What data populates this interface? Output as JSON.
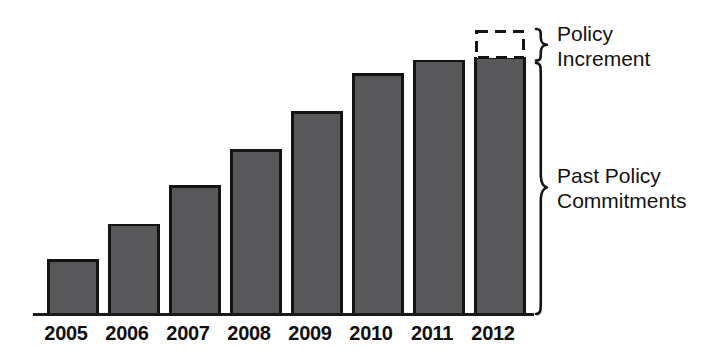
{
  "chart_data": {
    "type": "bar",
    "title": "",
    "subtitle": "",
    "xlabel": "",
    "ylabel": "",
    "grid": false,
    "legend_position": "right-brace-annotations",
    "categories": [
      "2005",
      "2006",
      "2007",
      "2008",
      "2009",
      "2010",
      "2011",
      "2012"
    ],
    "series": [
      {
        "name": "Past Policy Commitments",
        "values": [
          20.9,
          34.8,
          49.8,
          64.0,
          78.8,
          93.7,
          98.9,
          100.0
        ]
      }
    ],
    "values": [
      20.9,
      34.8,
      49.8,
      64.0,
      78.8,
      93.7,
      98.9,
      100.0
    ],
    "value_units": "relative index (2012 past-policy bar = 100)",
    "ylim": [
      0,
      111
    ],
    "annotations": [
      {
        "name": "policy-increment",
        "label_lines": [
          "Policy",
          "Increment"
        ],
        "style": "dashed-outline-box",
        "applies_to_category": "2012",
        "from_value": 100.0,
        "to_value": 111.0
      },
      {
        "name": "past-policy-commitments",
        "label_lines": [
          "Past Policy",
          "Commitments"
        ],
        "style": "solid-filled-bars",
        "from_value": 0,
        "to_value": 100.0
      }
    ],
    "colors": {
      "bar_fill": "#58585a",
      "bar_stroke": "#141414",
      "axis": "#1a1a1a",
      "dashed_box_stroke": "#141414",
      "dashed_box_fill": "#ffffff",
      "brace": "#141414",
      "text": "#121212",
      "background": "#ffffff"
    }
  },
  "axis": {
    "tick_labels": [
      "2005",
      "2006",
      "2007",
      "2008",
      "2009",
      "2010",
      "2011",
      "2012"
    ]
  },
  "annotations": {
    "policy_increment": {
      "line1": "Policy",
      "line2": "Increment"
    },
    "past_policy": {
      "line1": "Past Policy",
      "line2": "Commitments"
    }
  }
}
